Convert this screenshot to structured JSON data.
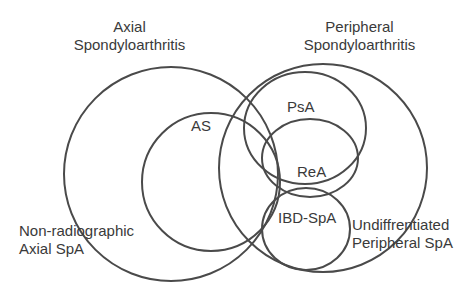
{
  "diagram": {
    "type": "venn",
    "stroke_color": "#4a4a4a",
    "text_color": "#3a3a3a",
    "groups": {
      "axial": {
        "line1": "Axial",
        "line2": "Spondyloarthritis"
      },
      "peripheral": {
        "line1": "Peripheral",
        "line2": "Spondyloarthritis"
      }
    },
    "sets": {
      "as": "AS",
      "nr_axial": {
        "line1": "Non-radiographic",
        "line2": "Axial SpA"
      },
      "psa": "PsA",
      "rea": "ReA",
      "ibd": "IBD-SpA",
      "undiff": {
        "line1": "Undiffrentiated",
        "line2": "Peripheral SpA"
      }
    }
  }
}
